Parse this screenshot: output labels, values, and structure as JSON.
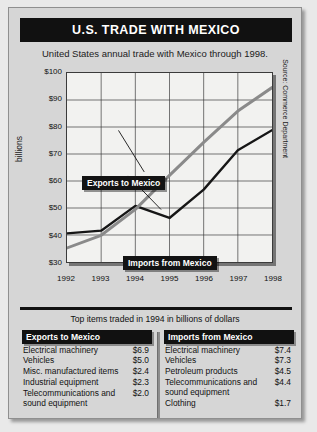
{
  "header": {
    "title": "U.S. TRADE WITH MEXICO",
    "subtitle": "United States annual trade with Mexico through 1998."
  },
  "chart_data": {
    "type": "line",
    "title": "U.S. Trade With Mexico",
    "xlabel": "",
    "ylabel": "billions",
    "x": [
      1992,
      1993,
      1994,
      1995,
      1996,
      1997,
      1998
    ],
    "categories": [
      "1992",
      "1993",
      "1994",
      "1995",
      "1996",
      "1997",
      "1998"
    ],
    "ylim": [
      30,
      100
    ],
    "yticks": [
      30,
      40,
      50,
      60,
      70,
      80,
      90,
      100
    ],
    "ytick_labels": [
      "$30",
      "$40",
      "$50",
      "$60",
      "$70",
      "$80",
      "$90",
      "$100"
    ],
    "grid": true,
    "legend_position": "inline-callouts",
    "series": [
      {
        "name": "Exports to Mexico",
        "color": "#161616",
        "values": [
          40.6,
          41.6,
          50.8,
          46.3,
          56.8,
          71.4,
          78.8
        ]
      },
      {
        "name": "Imports from Mexico",
        "color": "#8a8a8a",
        "values": [
          35.2,
          39.9,
          49.5,
          62.1,
          74.3,
          85.9,
          94.6
        ]
      }
    ],
    "annotations": [
      {
        "text": "Exports to Mexico"
      },
      {
        "text": "Imports from Mexico"
      }
    ],
    "source": "Source: Commerce Department"
  },
  "tables": {
    "caption": "Top items traded in 1994 in billions of dollars",
    "exports": {
      "header": "Exports to Mexico",
      "rows": [
        {
          "item": "Electrical machinery",
          "value": "$6.9"
        },
        {
          "item": "Vehicles",
          "value": "$5.0"
        },
        {
          "item": "Misc. manufactured items",
          "value": "$2.4"
        },
        {
          "item": "Industrial equipment",
          "value": "$2.3"
        },
        {
          "item": "Telecommunications and sound equipment",
          "value": "$2.0"
        }
      ]
    },
    "imports": {
      "header": "Imports from Mexico",
      "rows": [
        {
          "item": "Electrical machinery",
          "value": "$7.4"
        },
        {
          "item": "Vehicles",
          "value": "$7.3"
        },
        {
          "item": "Petroleum products",
          "value": "$4.5"
        },
        {
          "item": "Telecommunications and sound equipment",
          "value": "$4.4"
        },
        {
          "item": "Clothing",
          "value": "$1.7"
        }
      ]
    }
  }
}
